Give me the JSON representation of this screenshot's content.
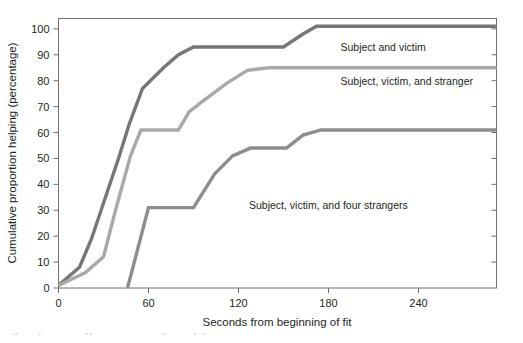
{
  "chart_data": {
    "type": "line",
    "title": "",
    "xlabel": "Seconds from beginning of fit",
    "ylabel": "Cumulative proportion helping (percentage)",
    "xlim": [
      0,
      292
    ],
    "ylim": [
      0,
      104
    ],
    "xticks": [
      0,
      60,
      120,
      180,
      240
    ],
    "xtick_labels": [
      "0",
      "60",
      "120",
      "180",
      "240"
    ],
    "yticks": [
      0,
      10,
      20,
      30,
      40,
      50,
      60,
      70,
      80,
      90,
      100
    ],
    "ytick_labels": [
      "0",
      "10",
      "20",
      "30",
      "40",
      "50",
      "60",
      "70",
      "80",
      "90",
      "100"
    ],
    "grid": false,
    "legend_position": "inline-right-of-curves",
    "series": [
      {
        "name": "Subject and victim",
        "label": "Subject and victim",
        "color": "#767676",
        "linewidth": 3.4,
        "label_x": 188,
        "label_y": 93,
        "points": [
          [
            0,
            1
          ],
          [
            14,
            8
          ],
          [
            22,
            19
          ],
          [
            40,
            50
          ],
          [
            47,
            63
          ],
          [
            56,
            77
          ],
          [
            70,
            85
          ],
          [
            80,
            90
          ],
          [
            90,
            93
          ],
          [
            150,
            93
          ],
          [
            163,
            98
          ],
          [
            172,
            101
          ],
          [
            292,
            101
          ]
        ]
      },
      {
        "name": "Subject, victim, and stranger",
        "label": "Subject, victim, and stranger",
        "color": "#a9a9a9",
        "linewidth": 3.4,
        "label_x": 188,
        "label_y": 80,
        "points": [
          [
            0,
            1
          ],
          [
            18,
            6
          ],
          [
            30,
            12
          ],
          [
            38,
            30
          ],
          [
            48,
            51
          ],
          [
            55,
            61
          ],
          [
            80,
            61
          ],
          [
            87,
            68
          ],
          [
            96,
            72
          ],
          [
            112,
            79
          ],
          [
            126,
            84
          ],
          [
            140,
            85
          ],
          [
            292,
            85
          ]
        ]
      },
      {
        "name": "Subject, victim, and four strangers",
        "label": "Subject, victim, and four strangers",
        "color": "#8d8d8d",
        "linewidth": 3.4,
        "label_x": 127,
        "label_y": 32,
        "points": [
          [
            46,
            0
          ],
          [
            60,
            31
          ],
          [
            90,
            31
          ],
          [
            104,
            44
          ],
          [
            116,
            51
          ],
          [
            128,
            54
          ],
          [
            152,
            54
          ],
          [
            163,
            59
          ],
          [
            175,
            61
          ],
          [
            292,
            61
          ]
        ]
      }
    ]
  },
  "axes": {
    "y_axis_title": "Cumulative proportion helping (percentage)",
    "x_axis_title": "Seconds from beginning of fit",
    "origin_label": "0"
  },
  "caption": {
    "text": "Figure caption text cropped at the bottom edge of the page"
  }
}
